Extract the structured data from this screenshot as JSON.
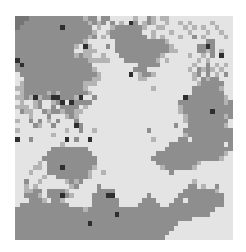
{
  "caption": "",
  "palette": {
    "0": "#e4e4e4",
    "1": "#b4b4b4",
    "2": "#8e8e8e",
    "3": "#2e2e2e",
    "4": "#757575"
  },
  "grid": {
    "cols": 48,
    "rows_count": 48,
    "rows": [
      "444222222222222122022000001002101100000000000000",
      "442222222222222212120201032012100100101000010000",
      "422222222232222220100122222210011000010101001000",
      "222222222222222221001222222200100010001000100100",
      "222222222222222212010222222220101000100201000010",
      "222222222222222100000022222222222100000000220000",
      "222222222222210310002022222222222210000022320000",
      "222222222222200111000022222222222211000022120100",
      "222222222222212110010002222222221000001001020300",
      "322222222222222211111000222222210100000010100000",
      "232222222222222220000000000222220000000100201010",
      "222222222222222221000000002220000000001021210100",
      "022222222222222222100000030122100000000120201020",
      "002222222222222221100000000110000000000102122000",
      "012222222222222111000000000000000000000012222200",
      "112222222222222100000000000000100000000222222100",
      "012222212122222210000000000000000000000222222200",
      "112131223322213002000000000000000000032222222210",
      "010012001230322220000000000000000000222222222212",
      "111012002022220100000000000000000000122222222222",
      "021100212212211000000000000000000000122222232222",
      "000100020001210000000000000000000000012222222212",
      "100202010200020000000000000000000000012222222220",
      "000021002000032000000000000000000002002222222210",
      "100000000001002001000000000002000000022222222222",
      "000000001000000000000000000000000000012222222222",
      "300200000003020030000000000000100000220222222222",
      "000000000010000000000000000000000022222222222202",
      "000000002222222200000000000000000222222222222222",
      "000000022222222220000000000000022222222222222210",
      "000000222222222222000000000000222222222222222100",
      "000001022222222222000000000000022222222210000000",
      "000011022232222221000000000000001222222100000000",
      "000100022222222210010000000000000020000000000000",
      "000000100222222210000000000000000000000000000000",
      "002001000001212000000000000000000000000100000000",
      "001010000000120000200000000000000000002201002000",
      "001122022221000000222200000000000000022222221000",
      "002221022232100002223300000002000000222222222200",
      "000222102210000002222220000022200002202222222200",
      "022222222222000002222220000222220022222222222200",
      "222222222222222122222222222222222222222222220000",
      "222222222222222222222232222222222222222222200000",
      "222222222222222222222222222222222222222000000000",
      "222222222222222232222222222222222222000000000000",
      "222222222222222222222222222222222220000000000000",
      "222222222222222222222222222222222200000000000000",
      "222222222222222222222222222222222000000000000000"
    ]
  }
}
